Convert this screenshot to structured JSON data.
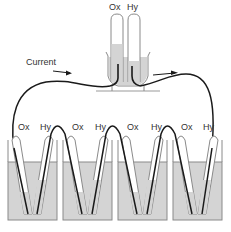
{
  "diagram": {
    "top_cell": {
      "labels": {
        "left": "Ox",
        "right": "Hy"
      }
    },
    "current": {
      "label": "Current"
    },
    "series_cells": {
      "labels": [
        "Ox",
        "Hy",
        "Ox",
        "Hy",
        "Ox",
        "Hy",
        "Ox",
        "Hy"
      ]
    },
    "colors": {
      "liquid": "#d4d4d4",
      "wire": "#1a1a1a",
      "glass_outline": "#8a8a8a",
      "gas": "#ffffff"
    }
  }
}
